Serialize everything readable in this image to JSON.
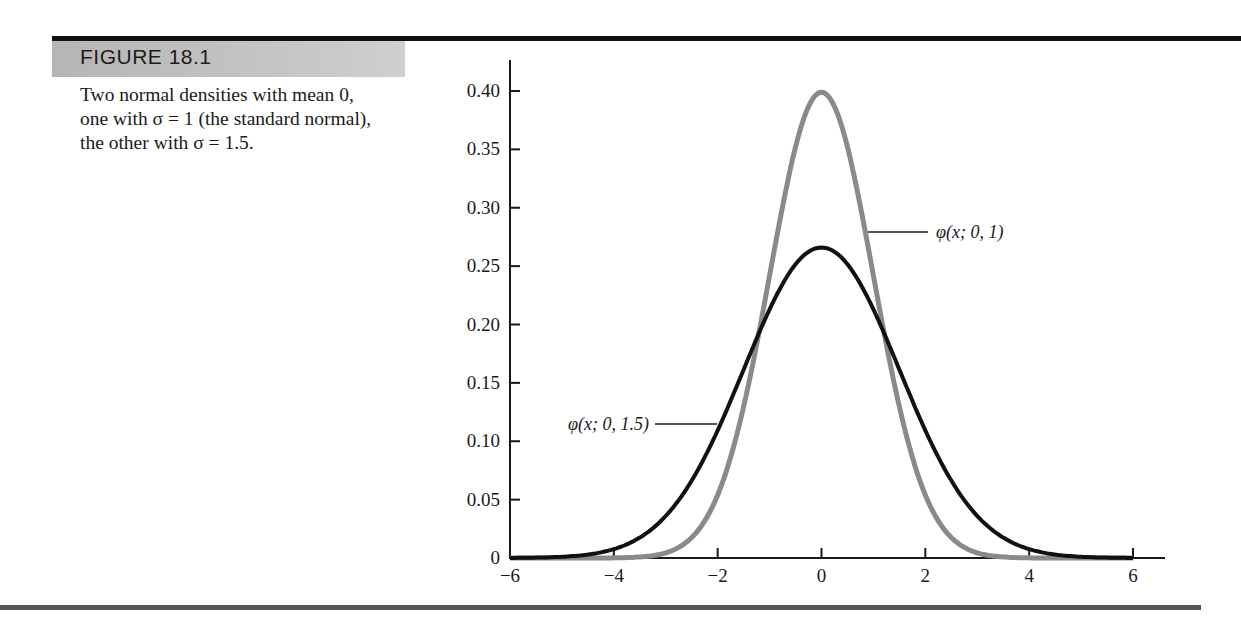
{
  "figure": {
    "label": "FIGURE 18.1",
    "caption": "Two normal densities with mean 0, one with σ = 1 (the standard normal), the other with σ = 1.5."
  },
  "colors": {
    "standard_normal": "#8a8a8a",
    "sigma_1_5": "#111111",
    "banner": "#c0c0c0"
  },
  "chart_data": {
    "type": "line",
    "title": "Two normal densities with mean 0",
    "xlabel": "",
    "ylabel": "",
    "xlim": [
      -6,
      6
    ],
    "ylim": [
      0,
      0.4
    ],
    "grid": false,
    "legend_position": "inline-annotations",
    "x_ticks": [
      -6,
      -4,
      -2,
      0,
      2,
      4,
      6
    ],
    "x_tick_labels": [
      "−6",
      "−4",
      "−2",
      "0",
      "2",
      "4",
      "6"
    ],
    "y_ticks": [
      0,
      0.05,
      0.1,
      0.15,
      0.2,
      0.25,
      0.3,
      0.35,
      0.4
    ],
    "y_tick_labels": [
      "0",
      "0.05",
      "0.10",
      "0.15",
      "0.20",
      "0.25",
      "0.30",
      "0.35",
      "0.40"
    ],
    "series": [
      {
        "name": "φ(x; 0, 1)",
        "mean": 0,
        "sigma": 1,
        "color": "#8a8a8a",
        "x": [
          -6,
          -4,
          -3,
          -2,
          -1.5,
          -1,
          -0.5,
          0,
          0.5,
          1,
          1.5,
          2,
          3,
          4,
          6
        ],
        "values": [
          0.0,
          0.0001,
          0.0044,
          0.054,
          0.1295,
          0.242,
          0.3521,
          0.3989,
          0.3521,
          0.242,
          0.1295,
          0.054,
          0.0044,
          0.0001,
          0.0
        ]
      },
      {
        "name": "φ(x; 0, 1.5)",
        "mean": 0,
        "sigma": 1.5,
        "color": "#111111",
        "x": [
          -6,
          -5,
          -4,
          -3,
          -2,
          -1.5,
          -1,
          -0.5,
          0,
          0.5,
          1,
          1.5,
          2,
          3,
          4,
          5,
          6
        ],
        "values": [
          0.0001,
          0.001,
          0.0076,
          0.036,
          0.1093,
          0.1613,
          0.213,
          0.2516,
          0.266,
          0.2516,
          0.213,
          0.1613,
          0.1093,
          0.036,
          0.0076,
          0.001,
          0.0001
        ]
      }
    ],
    "annotations": [
      {
        "text": "φ(x; 0, 1)",
        "series": "φ(x; 0, 1)",
        "position": "right of curve near y=0.30"
      },
      {
        "text": "φ(x; 0, 1.5)",
        "series": "φ(x; 0, 1.5)",
        "position": "left of curve near y=0.115"
      }
    ]
  }
}
